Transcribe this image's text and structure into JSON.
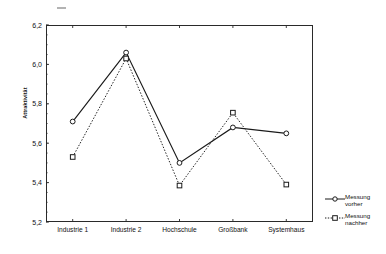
{
  "chart_data": {
    "type": "line",
    "title": "",
    "subtitle": "",
    "xlabel": "",
    "ylabel": "Attraktivität",
    "categories": [
      "Industrie 1",
      "Industrie 2",
      "Hochschule",
      "Großbank",
      "Systemhaus"
    ],
    "series": [
      {
        "name": "Messung\nvorher",
        "name_line1": "Messung",
        "name_line2": "vorher",
        "marker": "circle",
        "linestyle": "solid",
        "color": "#1a1a1a",
        "values": [
          5.71,
          6.06,
          5.5,
          5.68,
          5.65
        ]
      },
      {
        "name": "Messung\nnachher",
        "name_line1": "Messung",
        "name_line2": "nachher",
        "marker": "square",
        "linestyle": "dotted",
        "color": "#1a1a1a",
        "values": [
          5.53,
          6.03,
          5.385,
          5.755,
          5.39
        ]
      }
    ],
    "ylim": [
      5.2,
      6.2
    ],
    "yticks": [
      5.2,
      5.4,
      5.6,
      5.8,
      6.0,
      6.2
    ],
    "ytick_labels": [
      "5,2",
      "5,4",
      "5,6",
      "5,8",
      "6,0",
      "6,2"
    ],
    "grid": false,
    "legend_position": "right",
    "axis_color": "#2a2a2a"
  },
  "legend": {
    "entries": [
      {
        "line1": "Messung",
        "line2": "vorher"
      },
      {
        "line1": "Messung",
        "line2": "nachher"
      }
    ]
  }
}
